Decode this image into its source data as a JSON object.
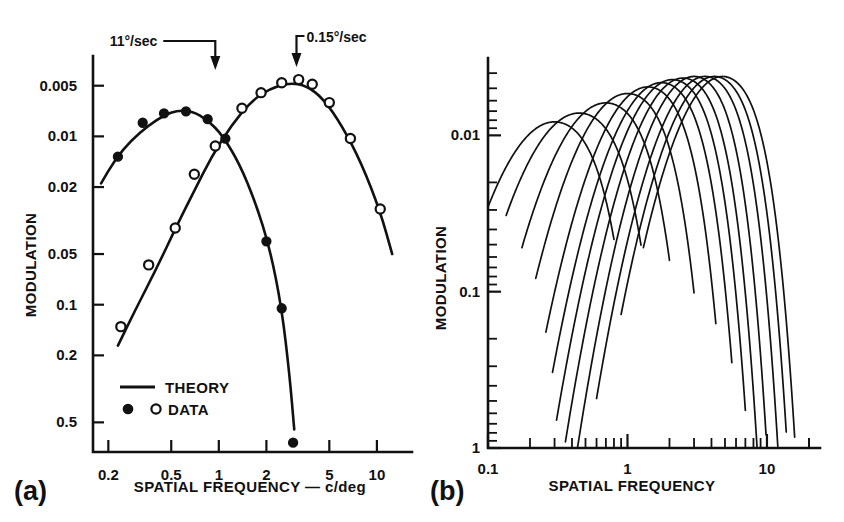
{
  "figure": {
    "panel_a_letter": "(a)",
    "panel_b_letter": "(b)"
  },
  "chart_data": [
    {
      "id": "panel-a",
      "type": "scatter",
      "title": "",
      "xlabel": "SPATIAL FREQUENCY — c/deg",
      "ylabel": "MODULATION",
      "xscale": "log",
      "yscale": "log",
      "y_inverted": true,
      "xlim": [
        0.16,
        14
      ],
      "ylim": [
        0.0045,
        0.75
      ],
      "grid": false,
      "legend_position": "lower-left",
      "xticks": [
        0.2,
        0.5,
        1,
        2,
        5,
        10
      ],
      "xticklabels": [
        "0.2",
        "0.5",
        "1",
        "2",
        "5",
        "10"
      ],
      "yticks": [
        0.005,
        0.01,
        0.02,
        0.05,
        0.1,
        0.2,
        0.5
      ],
      "yticklabels": [
        "0.005",
        "0.01",
        "0.02",
        "0.05",
        "0.1",
        "0.2",
        "0.5"
      ],
      "annotations": [
        {
          "text": "11°/sec",
          "target_x": 0.95,
          "label_side": "left"
        },
        {
          "text": "0.15°/sec",
          "target_x": 3.1,
          "label_side": "right"
        }
      ],
      "legend": [
        {
          "marker": "line",
          "label": "THEORY"
        },
        {
          "marker": "filled-and-open-circles",
          "label": "DATA"
        }
      ],
      "series": [
        {
          "name": "11°/sec",
          "marker": "filled-circle",
          "theory_curve": [
            [
              0.18,
              0.019
            ],
            [
              0.22,
              0.0138
            ],
            [
              0.28,
              0.0105
            ],
            [
              0.36,
              0.0086
            ],
            [
              0.45,
              0.0075
            ],
            [
              0.55,
              0.007
            ],
            [
              0.68,
              0.0071
            ],
            [
              0.85,
              0.008
            ],
            [
              1.05,
              0.0098
            ],
            [
              1.35,
              0.0145
            ],
            [
              1.7,
              0.0245
            ],
            [
              2.1,
              0.046
            ],
            [
              2.5,
              0.105
            ],
            [
              2.8,
              0.26
            ],
            [
              3.0,
              0.55
            ],
            [
              3.1,
              0.78
            ]
          ],
          "points": [
            [
              0.23,
              0.0132
            ],
            [
              0.33,
              0.0083
            ],
            [
              0.45,
              0.0073
            ],
            [
              0.62,
              0.0071
            ],
            [
              0.85,
              0.0079
            ],
            [
              1.1,
              0.0103
            ],
            [
              2.0,
              0.042
            ],
            [
              2.5,
              0.105
            ],
            [
              2.95,
              0.66
            ]
          ]
        },
        {
          "name": "0.15°/sec",
          "marker": "open-circle",
          "theory_curve": [
            [
              0.23,
              0.175
            ],
            [
              0.3,
              0.105
            ],
            [
              0.4,
              0.062
            ],
            [
              0.55,
              0.033
            ],
            [
              0.7,
              0.021
            ],
            [
              0.9,
              0.0132
            ],
            [
              1.2,
              0.0086
            ],
            [
              1.6,
              0.0062
            ],
            [
              2.1,
              0.0052
            ],
            [
              2.8,
              0.0048
            ],
            [
              3.6,
              0.005
            ],
            [
              4.6,
              0.006
            ],
            [
              6.0,
              0.0086
            ],
            [
              8.0,
              0.0145
            ],
            [
              10.5,
              0.028
            ],
            [
              12.5,
              0.05
            ]
          ],
          "points": [
            [
              0.24,
              0.135
            ],
            [
              0.36,
              0.058
            ],
            [
              0.53,
              0.035
            ],
            [
              0.7,
              0.0168
            ],
            [
              0.95,
              0.0114
            ],
            [
              1.4,
              0.0068
            ],
            [
              1.85,
              0.0055
            ],
            [
              2.5,
              0.0048
            ],
            [
              3.2,
              0.0046
            ],
            [
              3.9,
              0.0049
            ],
            [
              5.0,
              0.0063
            ],
            [
              6.8,
              0.0103
            ],
            [
              10.5,
              0.027
            ]
          ]
        }
      ]
    },
    {
      "id": "panel-b",
      "type": "line",
      "title": "",
      "xlabel": "SPATIAL FREQUENCY",
      "ylabel": "MODULATION",
      "xscale": "log",
      "yscale": "log",
      "y_inverted": true,
      "xlim": [
        0.1,
        24
      ],
      "ylim": [
        0.0032,
        1.0
      ],
      "grid": false,
      "legend_position": "none",
      "xticks": [
        0.1,
        1,
        10
      ],
      "xticklabels": [
        "0.1",
        "1",
        "10"
      ],
      "yticks": [
        0.01,
        0.1,
        1
      ],
      "yticklabels": [
        "0.01",
        "0.1",
        "1"
      ],
      "annotations": [],
      "curve_count": 12,
      "description": "Family of overlapping inverted-U contrast sensitivity curves, peaks shifting right and upward",
      "curves": [
        {
          "name": "curve-1",
          "peak_x": 0.3,
          "peak_y": 0.0082,
          "width": 0.62,
          "low_x": 0.1,
          "high_x": 0.8
        },
        {
          "name": "curve-2",
          "peak_x": 0.45,
          "peak_y": 0.0072,
          "width": 0.62,
          "low_x": 0.135,
          "high_x": 1.25
        },
        {
          "name": "curve-3",
          "peak_x": 0.7,
          "peak_y": 0.0062,
          "width": 0.6,
          "low_x": 0.175,
          "high_x": 2.0
        },
        {
          "name": "curve-4",
          "peak_x": 1.0,
          "peak_y": 0.0054,
          "width": 0.58,
          "low_x": 0.22,
          "high_x": 3.0
        },
        {
          "name": "curve-5",
          "peak_x": 1.4,
          "peak_y": 0.0049,
          "width": 0.56,
          "low_x": 0.26,
          "high_x": 4.3
        },
        {
          "name": "curve-6",
          "peak_x": 1.75,
          "peak_y": 0.0046,
          "width": 0.55,
          "low_x": 0.29,
          "high_x": 5.6
        },
        {
          "name": "curve-7",
          "peak_x": 2.1,
          "peak_y": 0.0044,
          "width": 0.54,
          "low_x": 0.31,
          "high_x": 7.0
        },
        {
          "name": "curve-8",
          "peak_x": 2.5,
          "peak_y": 0.0043,
          "width": 0.53,
          "low_x": 0.34,
          "high_x": 8.8
        },
        {
          "name": "curve-9",
          "peak_x": 3.0,
          "peak_y": 0.0042,
          "width": 0.52,
          "low_x": 0.4,
          "high_x": 11.0
        },
        {
          "name": "curve-10",
          "peak_x": 3.6,
          "peak_y": 0.0042,
          "width": 0.52,
          "low_x": 0.6,
          "high_x": 14.0
        },
        {
          "name": "curve-11",
          "peak_x": 4.2,
          "peak_y": 0.0042,
          "width": 0.52,
          "low_x": 0.9,
          "high_x": 17.0
        },
        {
          "name": "curve-12",
          "peak_x": 4.8,
          "peak_y": 0.0042,
          "width": 0.52,
          "low_x": 1.3,
          "high_x": 19.5
        }
      ]
    }
  ]
}
